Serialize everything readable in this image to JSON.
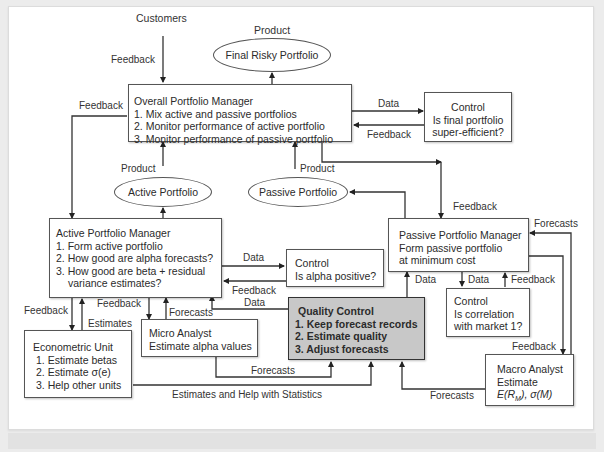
{
  "diagram": {
    "top_labels": {
      "customers": "Customers",
      "product_top": "Product",
      "feedback_customers": "Feedback"
    },
    "ellipses": {
      "final_risky": "Final Risky Portfolio",
      "active": "Active Portfolio",
      "passive": "Passive Portfolio"
    },
    "overall_manager": {
      "title": "Overall Portfolio Manager",
      "items": [
        "1. Mix active and passive portfolios",
        "2. Monitor performance of active portfolio",
        "3. Monitor performance of passive portfolio"
      ]
    },
    "control_final": {
      "lines": [
        "Control",
        "Is final portfolio",
        "super-efficient?"
      ]
    },
    "active_manager": {
      "title": "Active Portfolio Manager",
      "items": [
        "1. Form active portfolio",
        "2. How good are alpha forecasts?",
        "3. How good are beta + residual",
        "variance estimates?"
      ]
    },
    "control_alpha": {
      "lines": [
        "Control",
        "Is alpha positive?"
      ]
    },
    "passive_manager": {
      "lines": [
        "Passive Portfolio Manager",
        "Form passive portfolio",
        "at minimum  cost"
      ]
    },
    "control_correlation": {
      "lines": [
        "Control",
        "Is correlation",
        "with market 1?"
      ]
    },
    "quality_control": {
      "title": "Quality Control",
      "items": [
        "1. Keep forecast records",
        "2. Estimate quality",
        "3. Adjust forecasts"
      ]
    },
    "econometric_unit": {
      "title": "Econometric Unit",
      "items": [
        "1. Estimate betas",
        "2. Estimate σ(e)",
        "3. Help other units"
      ]
    },
    "micro_analyst": {
      "lines": [
        "Micro Analyst",
        "Estimate alpha values"
      ]
    },
    "macro_analyst": {
      "lines": [
        "Macro Analyst",
        "Estimate"
      ],
      "formula_prefix": "E(R",
      "formula_sub": "M",
      "formula_suffix": "), σ(M)"
    },
    "edge_labels": {
      "feedback_left": "Feedback",
      "data_control_final": "Data",
      "feedback_control_final": "Feedback",
      "product_active": "Product",
      "product_passive": "Product",
      "feedback_passive_mgr": "Feedback",
      "forecasts_passive": "Forecasts",
      "data_control_alpha": "Data",
      "feedback_control_alpha": "Feedback",
      "data_qc": "Data",
      "data_passive_qc": "Data",
      "data_corr": "Data",
      "feedback_corr": "Feedback",
      "feedback_econ": "Feedback",
      "estimates_econ": "Estimates",
      "feedback_micro": "Feedback",
      "forecasts_micro": "Forecasts",
      "forecasts_micro_qc": "Forecasts",
      "estimates_help": "Estimates and Help with Statistics",
      "forecasts_macro": "Forecasts",
      "feedback_macro": "Feedback"
    }
  }
}
